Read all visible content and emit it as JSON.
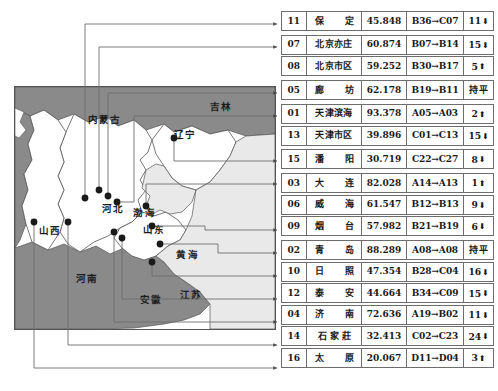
{
  "map": {
    "title": "",
    "province_labels": [
      {
        "text": "内蒙古",
        "x": 74,
        "y": 37
      },
      {
        "text": "吉林",
        "x": 196,
        "y": 24
      },
      {
        "text": "辽宁",
        "x": 160,
        "y": 52
      },
      {
        "text": "河北",
        "x": 88,
        "y": 126
      },
      {
        "text": "山西",
        "x": 25,
        "y": 148
      },
      {
        "text": "山东",
        "x": 129,
        "y": 147
      },
      {
        "text": "河南",
        "x": 62,
        "y": 196
      },
      {
        "text": "安徽",
        "x": 126,
        "y": 217
      },
      {
        "text": "江苏",
        "x": 166,
        "y": 212
      }
    ],
    "sea_labels": [
      {
        "text": "渤海",
        "x": 119,
        "y": 130
      },
      {
        "text": "黄海",
        "x": 162,
        "y": 172
      }
    ],
    "colors": {
      "outer_province": "#8a8a8a",
      "inner_province": "#ffffff",
      "sea": "#e9e9e9",
      "border": "#555555",
      "marker": "#1a1a1a",
      "leader_line": "#6d6d6d"
    }
  },
  "table": {
    "columns": [
      "排名",
      "城市",
      "得分",
      "区间变化",
      "名次变化"
    ],
    "rows": [
      {
        "rank": "11",
        "city": "保　定",
        "spacing": "spaced",
        "score": "45.848",
        "move": "B36→C07",
        "delta": "11",
        "dir": "down",
        "gap_after": true
      },
      {
        "rank": "07",
        "city": "北京亦庄",
        "spacing": "",
        "score": "60.874",
        "move": "B07→B14",
        "delta": "15",
        "dir": "down",
        "gap_after": false
      },
      {
        "rank": "08",
        "city": "北京市区",
        "spacing": "",
        "score": "59.252",
        "move": "B30→B17",
        "delta": "5",
        "dir": "up",
        "gap_after": true
      },
      {
        "rank": "05",
        "city": "廊　坊",
        "spacing": "spaced",
        "score": "62.178",
        "move": "B19→B11",
        "delta": "",
        "dir": "flat",
        "gap_after": true
      },
      {
        "rank": "01",
        "city": "天津滨海",
        "spacing": "",
        "score": "93.378",
        "move": "A05→A03",
        "delta": "2",
        "dir": "up",
        "gap_after": false
      },
      {
        "rank": "13",
        "city": "天津市区",
        "spacing": "",
        "score": "39.896",
        "move": "C01→C13",
        "delta": "15",
        "dir": "down",
        "gap_after": true
      },
      {
        "rank": "15",
        "city": "潘　阳",
        "spacing": "spaced",
        "score": "30.719",
        "move": "C22→C27",
        "delta": "8",
        "dir": "down",
        "gap_after": true
      },
      {
        "rank": "03",
        "city": "大　连",
        "spacing": "spaced",
        "score": "82.028",
        "move": "A14→A13",
        "delta": "1",
        "dir": "up",
        "gap_after": false
      },
      {
        "rank": "06",
        "city": "威　海",
        "spacing": "spaced",
        "score": "61.547",
        "move": "B12→B13",
        "delta": "9",
        "dir": "down",
        "gap_after": false
      },
      {
        "rank": "09",
        "city": "烟　台",
        "spacing": "spaced",
        "score": "57.982",
        "move": "B21→B19",
        "delta": "6",
        "dir": "down",
        "gap_after": true
      },
      {
        "rank": "02",
        "city": "青　岛",
        "spacing": "spaced",
        "score": "88.289",
        "move": "A08→A08",
        "delta": "",
        "dir": "flat",
        "gap_after": false
      },
      {
        "rank": "10",
        "city": "日　照",
        "spacing": "spaced",
        "score": "47.354",
        "move": "B28→C04",
        "delta": "16",
        "dir": "down",
        "gap_after": false
      },
      {
        "rank": "12",
        "city": "泰　安",
        "spacing": "spaced",
        "score": "44.664",
        "move": "B34→C09",
        "delta": "15",
        "dir": "down",
        "gap_after": false
      },
      {
        "rank": "04",
        "city": "济　南",
        "spacing": "spaced",
        "score": "72.636",
        "move": "A19→B02",
        "delta": "11",
        "dir": "down",
        "gap_after": false
      },
      {
        "rank": "14",
        "city": "石家莊",
        "spacing": "spaced3",
        "score": "32.413",
        "move": "C02→C23",
        "delta": "24",
        "dir": "down",
        "gap_after": false
      },
      {
        "rank": "16",
        "city": "太　原",
        "spacing": "spaced",
        "score": "20.067",
        "move": "D11→D04",
        "delta": "3",
        "dir": "up",
        "gap_after": false
      }
    ],
    "glyphs": {
      "up": "⬆",
      "down": "⬇",
      "flat": "持平"
    }
  }
}
